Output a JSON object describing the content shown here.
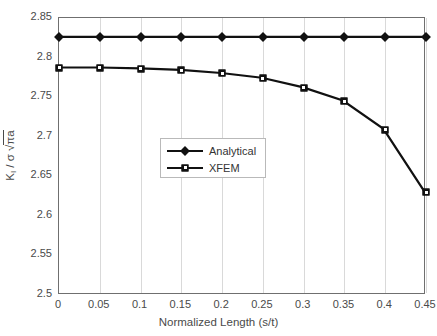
{
  "chart_data": {
    "type": "line",
    "title": "",
    "subtitle": "",
    "xlabel": "Normalized Length (s/t)",
    "ylabel": "K_I / σ √(πa)",
    "ylabel_parts": {
      "k": "K",
      "k_sub": "I",
      "mid": " / σ ",
      "rad": "√πa"
    },
    "xlim": [
      0,
      0.45
    ],
    "ylim": [
      2.5,
      2.85
    ],
    "x": [
      0,
      0.05,
      0.1,
      0.15,
      0.2,
      0.25,
      0.3,
      0.35,
      0.4,
      0.45
    ],
    "xticks": [
      "0",
      "0.05",
      "0.1",
      "0.15",
      "0.2",
      "0.25",
      "0.3",
      "0.35",
      "0.4",
      "0.45"
    ],
    "yticks": [
      "2.5",
      "2.55",
      "2.6",
      "2.65",
      "2.7",
      "2.75",
      "2.8",
      "2.85"
    ],
    "ytick_values": [
      2.5,
      2.55,
      2.6,
      2.65,
      2.7,
      2.75,
      2.8,
      2.85
    ],
    "grid": "vertical",
    "legend_position": "center",
    "series": [
      {
        "name": "Analytical",
        "marker": "diamond",
        "color": "#111111",
        "values": [
          2.826,
          2.826,
          2.826,
          2.826,
          2.826,
          2.826,
          2.826,
          2.826,
          2.826,
          2.826
        ]
      },
      {
        "name": "XFEM",
        "marker": "square",
        "color": "#111111",
        "values": [
          2.787,
          2.787,
          2.786,
          2.784,
          2.78,
          2.774,
          2.762,
          2.745,
          2.709,
          2.63
        ]
      }
    ]
  },
  "legend": {
    "entries": [
      {
        "label": "Analytical"
      },
      {
        "label": "XFEM"
      }
    ]
  },
  "colors": {
    "line": "#111111",
    "grid": "#d9d9d9",
    "axis": "#6f6f6f",
    "text": "#4a4a4a",
    "background": "#ffffff"
  }
}
